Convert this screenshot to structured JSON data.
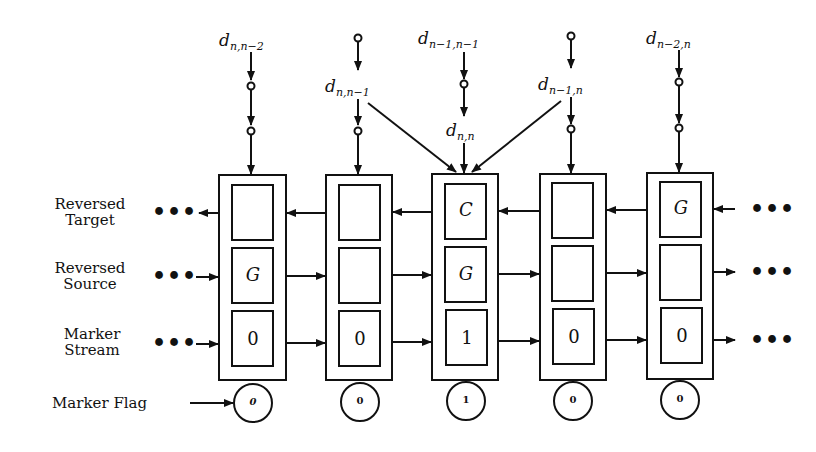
{
  "diagram": {
    "row_labels": {
      "reversed_target": [
        "Reversed",
        "Target"
      ],
      "reversed_source": [
        "Reversed",
        "Source"
      ],
      "marker_stream": [
        "Marker",
        "Stream"
      ],
      "marker_flag": "Marker Flag"
    },
    "ellipsis": "•••",
    "inputs": [
      {
        "base": "d",
        "sub": "n,n−2"
      },
      {
        "base": "d",
        "sub": "n,n−1"
      },
      {
        "base": "d",
        "sub": "n−1,n−1"
      },
      {
        "base": "d",
        "sub": "n,n"
      },
      {
        "base": "d",
        "sub": "n−1,n"
      },
      {
        "base": "d",
        "sub": "n−2,n"
      }
    ],
    "cells": [
      {
        "target": "",
        "source": "G",
        "marker": "0",
        "flag": "0"
      },
      {
        "target": "",
        "source": "",
        "marker": "0",
        "flag": "0"
      },
      {
        "target": "C",
        "source": "G",
        "marker": "1",
        "flag": "1"
      },
      {
        "target": "",
        "source": "",
        "marker": "0",
        "flag": "0"
      },
      {
        "target": "G",
        "source": "",
        "marker": "0",
        "flag": "0"
      }
    ]
  }
}
